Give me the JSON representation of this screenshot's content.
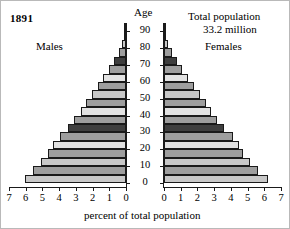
{
  "title": {
    "year": "1891",
    "age_axis_label": "Age",
    "total_population_line1": "Total population",
    "total_population_line2": "33.2 million",
    "males_label": "Males",
    "females_label": "Females",
    "x_axis_title": "percent of total population"
  },
  "chart_data": {
    "type": "bar",
    "subtype": "population-pyramid",
    "title": "1891",
    "annotations": [
      "Total population",
      "33.2 million",
      "Males",
      "Females"
    ],
    "xlabel": "percent of total population",
    "ylabel": "Age",
    "grid": false,
    "legend": "none",
    "xlim_left": [
      7,
      0
    ],
    "xlim_right": [
      0,
      7
    ],
    "x_ticks_left": [
      "7",
      "6",
      "5",
      "4",
      "3",
      "2",
      "1",
      "0"
    ],
    "x_ticks_right": [
      "0",
      "1",
      "2",
      "3",
      "4",
      "5",
      "6",
      "7"
    ],
    "y_ticks": [
      "0",
      "10",
      "20",
      "30",
      "40",
      "50",
      "60",
      "70",
      "80",
      "90"
    ],
    "age_groups": [
      "0-4",
      "5-9",
      "10-14",
      "15-19",
      "20-24",
      "25-29",
      "30-34",
      "35-39",
      "40-44",
      "45-49",
      "50-54",
      "55-59",
      "60-64",
      "65-69",
      "70-74",
      "75-79",
      "80-84",
      "85-89",
      "90+"
    ],
    "series": [
      {
        "name": "Males",
        "side": "left",
        "values": [
          6.05,
          5.55,
          5.1,
          4.65,
          4.35,
          3.95,
          3.5,
          3.1,
          2.7,
          2.4,
          2.05,
          1.7,
          1.35,
          1.0,
          0.7,
          0.42,
          0.22,
          0.1,
          0.04
        ]
      },
      {
        "name": "Females",
        "side": "right",
        "values": [
          6.2,
          5.6,
          5.15,
          4.75,
          4.5,
          4.1,
          3.6,
          3.2,
          2.8,
          2.5,
          2.15,
          1.8,
          1.45,
          1.1,
          0.78,
          0.48,
          0.26,
          0.12,
          0.05
        ]
      }
    ],
    "bar_shading": [
      "#c8c8c8",
      "#9e9e9e",
      "#c8c8c8",
      "#9e9e9e",
      "#e2e2e2",
      "#9e9e9e",
      "#3f3f3f",
      "#9e9e9e",
      "#e2e2e2",
      "#9e9e9e",
      "#c8c8c8",
      "#9e9e9e",
      "#e2e2e2",
      "#9e9e9e",
      "#3f3f3f",
      "#9e9e9e",
      "#c8c8c8",
      "#9e9e9e",
      "#c8c8c8"
    ],
    "colors": {
      "light": "#e2e2e2",
      "mid_light": "#c8c8c8",
      "mid": "#9e9e9e",
      "dark": "#3f3f3f",
      "outline": "#1a1a1a",
      "background": "#ffffff"
    }
  }
}
